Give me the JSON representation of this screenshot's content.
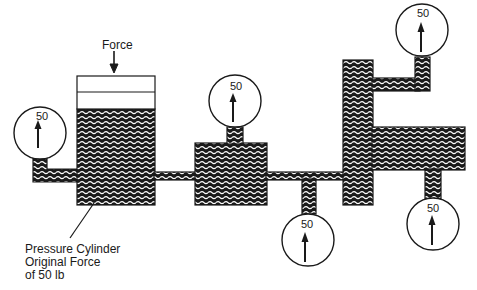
{
  "diagram": {
    "title_force": "Force",
    "callout": {
      "line1": "Pressure Cylinder",
      "line2": "Original Force",
      "line3": "of 50 lb"
    },
    "gauges": [
      {
        "id": "left",
        "value": "50"
      },
      {
        "id": "middle-top",
        "value": "50"
      },
      {
        "id": "middle-bottom",
        "value": "50"
      },
      {
        "id": "top-right",
        "value": "50"
      },
      {
        "id": "bottom-right",
        "value": "50"
      }
    ],
    "colors": {
      "ink": "#1a1a1a",
      "paper": "#ffffff"
    }
  }
}
